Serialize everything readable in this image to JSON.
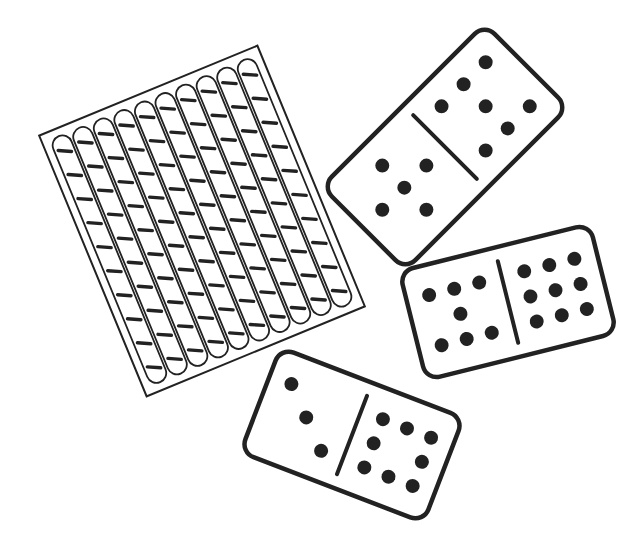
{
  "illustration": {
    "title": "Hundred frame and dominoes",
    "colors": {
      "stroke": "#222222",
      "background": "#ffffff"
    },
    "hundred_frame": {
      "columns": 10,
      "marks_per_column": 10,
      "center": [
        202,
        221
      ],
      "rotation_deg": -22.4,
      "width": 236,
      "height": 282
    },
    "dominoes": [
      {
        "name": "domino-5-7",
        "halves": [
          5,
          7
        ],
        "center": [
          445,
          147
        ],
        "rotation_deg": -45,
        "length": 230,
        "breadth": 118
      },
      {
        "name": "domino-7-9",
        "halves": [
          7,
          9
        ],
        "center": [
          508,
          302
        ],
        "rotation_deg": -14,
        "length": 196,
        "breadth": 112
      },
      {
        "name": "domino-3-8",
        "halves": [
          3,
          8
        ],
        "center": [
          352,
          435
        ],
        "rotation_deg": 21,
        "length": 196,
        "breadth": 112
      }
    ]
  }
}
